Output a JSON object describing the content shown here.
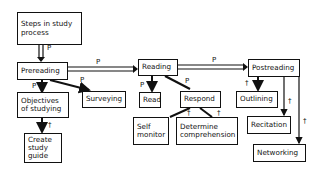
{
  "nodes": {
    "steps": "Steps in study\nprocess",
    "prereading": "Prereading",
    "objectives": "Objectives\nof studying",
    "create_guide": "Create\nstudy\nguide",
    "surveying": "Surveying",
    "reading": "Reading",
    "read": "Read",
    "respond": "Respond",
    "self_monitor": "Self\nmonitor",
    "determine": "Determine\ncomprehension",
    "postreading": "Postreading",
    "outlining": "Outlining",
    "recitation": "Recitation",
    "networking": "Networking"
  },
  "edge_labels": {
    "p": "P",
    "t": "†"
  }
}
